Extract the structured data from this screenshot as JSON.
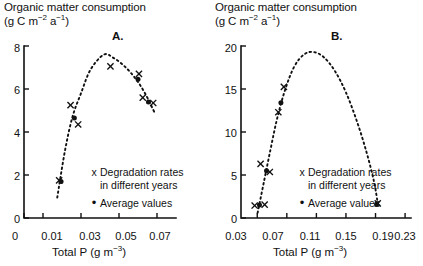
{
  "figure": {
    "panels": [
      {
        "id": "A",
        "label": "A.",
        "ytitle_line1": "Organic matter consumption",
        "ytitle_unit_pre": "(g C m",
        "ytitle_unit_sup1": "−2",
        "ytitle_unit_mid": " a",
        "ytitle_unit_sup2": "−1",
        "ytitle_unit_post": ")",
        "xcaption_pre": "Total P (g m",
        "xcaption_sup": "−3",
        "xcaption_post": ")",
        "legend": {
          "x_mark": "x",
          "x_line1": "Degradation rates",
          "x_line2": "in different years",
          "dot_mark": "•",
          "dot_line1": "Average values"
        }
      },
      {
        "id": "B",
        "label": "B.",
        "ytitle_line1": "Organic matter consumption",
        "ytitle_unit_pre": "(g C m",
        "ytitle_unit_sup1": "−2",
        "ytitle_unit_mid": " a",
        "ytitle_unit_sup2": "−1",
        "ytitle_unit_post": ")",
        "xcaption_pre": "Total P (g m",
        "xcaption_sup": "−3",
        "xcaption_post": ")",
        "legend": {
          "x_mark": "x",
          "x_line1": "Degradation rates",
          "x_line2": "in different years",
          "dot_mark": "•",
          "dot_line1": "Average values"
        }
      }
    ]
  },
  "chart_data": [
    {
      "type": "scatter",
      "panel": "A",
      "title": "Organic matter consumption (g C m-2 a-1)",
      "xlabel": "Total P (g m-3)",
      "ylabel": "Organic matter consumption (g C m-2 a-1)",
      "xlim": [
        0,
        0.08
      ],
      "ylim": [
        0,
        8
      ],
      "xticks": [
        0,
        0.01,
        0.03,
        0.05,
        0.07
      ],
      "xticklabels": [
        "0",
        "0.01",
        "0.03",
        "0.05",
        "0.07"
      ],
      "yticks": [
        0,
        2,
        4,
        6,
        8
      ],
      "yticklabels": [
        "0",
        "2",
        "4",
        "6",
        "8"
      ],
      "grid": false,
      "legend_position": "inside-lower-right",
      "series": [
        {
          "name": "Degradation rates in different years",
          "marker": "x",
          "points": [
            {
              "x": 0.0185,
              "y": 1.75
            },
            {
              "x": 0.0245,
              "y": 5.25
            },
            {
              "x": 0.0285,
              "y": 4.35
            },
            {
              "x": 0.0455,
              "y": 7.05
            },
            {
              "x": 0.0605,
              "y": 6.7
            },
            {
              "x": 0.0625,
              "y": 5.6
            },
            {
              "x": 0.068,
              "y": 5.35
            }
          ]
        },
        {
          "name": "Average values",
          "marker": "dot",
          "points": [
            {
              "x": 0.0195,
              "y": 1.7
            },
            {
              "x": 0.0265,
              "y": 4.65
            },
            {
              "x": 0.06,
              "y": 6.45
            },
            {
              "x": 0.0655,
              "y": 5.4
            }
          ]
        }
      ],
      "fit_curve": {
        "style": "dotted",
        "description": "unimodal hump-shaped dotted fit",
        "points": [
          {
            "x": 0.0175,
            "y": 0.95
          },
          {
            "x": 0.0215,
            "y": 3.1
          },
          {
            "x": 0.0255,
            "y": 4.7
          },
          {
            "x": 0.03,
            "y": 5.8
          },
          {
            "x": 0.035,
            "y": 6.9
          },
          {
            "x": 0.042,
            "y": 7.6
          },
          {
            "x": 0.047,
            "y": 7.45
          },
          {
            "x": 0.053,
            "y": 7.05
          },
          {
            "x": 0.059,
            "y": 6.45
          },
          {
            "x": 0.064,
            "y": 5.75
          },
          {
            "x": 0.069,
            "y": 4.85
          }
        ]
      }
    },
    {
      "type": "scatter",
      "panel": "B",
      "title": "Organic matter consumption (g C m-2 a-1)",
      "xlabel": "Total P (g m-3)",
      "ylabel": "Organic matter consumption (g C m-2 a-1)",
      "xlim": [
        0.008,
        0.238
      ],
      "ylim": [
        0,
        20
      ],
      "xticks": [
        0.03,
        0.07,
        0.11,
        0.15,
        0.19,
        0.23
      ],
      "xticklabels": [
        "0.03",
        "0.07",
        "0.11",
        "0.15",
        "0.19",
        "0.23"
      ],
      "yticks": [
        0,
        5,
        10,
        15,
        20
      ],
      "yticklabels": [
        "0",
        "5",
        "10",
        "15",
        "20"
      ],
      "grid": false,
      "legend_position": "inside-lower-center",
      "series": [
        {
          "name": "Degradation rates in different years",
          "marker": "x",
          "points": [
            {
              "x": 0.0265,
              "y": 1.45
            },
            {
              "x": 0.04,
              "y": 1.55
            },
            {
              "x": 0.0345,
              "y": 6.3
            },
            {
              "x": 0.047,
              "y": 5.35
            },
            {
              "x": 0.0585,
              "y": 12.3
            },
            {
              "x": 0.066,
              "y": 15.25
            },
            {
              "x": 0.193,
              "y": 1.7
            }
          ]
        },
        {
          "name": "Average values",
          "marker": "dot",
          "points": [
            {
              "x": 0.033,
              "y": 1.5
            },
            {
              "x": 0.0425,
              "y": 5.5
            },
            {
              "x": 0.062,
              "y": 13.4
            },
            {
              "x": 0.1915,
              "y": 1.6
            }
          ]
        }
      ],
      "fit_curve": {
        "style": "dotted",
        "description": "unimodal hump-shaped dotted fit",
        "points": [
          {
            "x": 0.0305,
            "y": 0.6
          },
          {
            "x": 0.039,
            "y": 4.2
          },
          {
            "x": 0.048,
            "y": 8.0
          },
          {
            "x": 0.057,
            "y": 11.6
          },
          {
            "x": 0.068,
            "y": 15.0
          },
          {
            "x": 0.08,
            "y": 17.6
          },
          {
            "x": 0.093,
            "y": 19.0
          },
          {
            "x": 0.106,
            "y": 19.3
          },
          {
            "x": 0.12,
            "y": 18.7
          },
          {
            "x": 0.135,
            "y": 17.1
          },
          {
            "x": 0.15,
            "y": 14.6
          },
          {
            "x": 0.165,
            "y": 11.2
          },
          {
            "x": 0.178,
            "y": 7.6
          },
          {
            "x": 0.188,
            "y": 4.2
          },
          {
            "x": 0.193,
            "y": 1.7
          }
        ]
      }
    }
  ]
}
